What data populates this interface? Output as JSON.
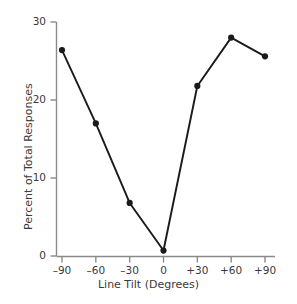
{
  "chart_data": {
    "type": "line",
    "title": "",
    "xlabel": "Line Tilt (Degrees)",
    "ylabel": "Percent of Total Responses",
    "x": [
      -90,
      -60,
      -30,
      0,
      30,
      60,
      90
    ],
    "xtick_labels": [
      "–90",
      "–60",
      "–30",
      "0",
      "+30",
      "+60",
      "+90"
    ],
    "values": [
      26.4,
      17.0,
      6.8,
      0.7,
      21.8,
      28.0,
      25.6
    ],
    "ytick_labels": [
      "0",
      "10",
      "20",
      "30"
    ],
    "yticks": [
      0,
      10,
      20,
      30
    ],
    "ylim": [
      0,
      30
    ],
    "xlim": [
      -90,
      90
    ],
    "grid": false,
    "legend": false,
    "marker": "filled-circle",
    "line_color": "#1a1a1a",
    "marker_color": "#1a1a1a",
    "axis_color": "#808080",
    "text_color": "#3a3a3a"
  }
}
